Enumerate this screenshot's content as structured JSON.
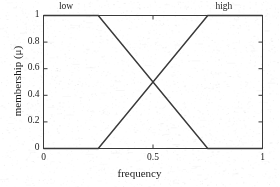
{
  "chart_data": {
    "type": "line",
    "title": "",
    "subtitle": "",
    "xlabel": "frequency",
    "ylabel": "membership (μ)",
    "xlim": [
      0,
      1
    ],
    "ylim": [
      0,
      1
    ],
    "xticks": [
      0,
      0.5,
      1
    ],
    "xticklabels": [
      "0",
      "0.5",
      "1"
    ],
    "yticks": [
      0,
      0.2,
      0.4,
      0.6,
      0.8,
      1
    ],
    "yticklabels": [
      "0",
      "0.2",
      "0.4",
      "0.6",
      "0.8",
      "1"
    ],
    "grid": false,
    "legend_position": "inline-annotations",
    "line_color": "#3a3a3a",
    "axis_color": "#3a3a3a",
    "background_color": "#ffffff",
    "annotations": [
      {
        "text": "low",
        "x": 0.125,
        "y": 1.06
      },
      {
        "text": "high",
        "x": 0.84,
        "y": 1.06
      }
    ],
    "series": [
      {
        "name": "low",
        "label": "low",
        "x": [
          0,
          0.25,
          0.75,
          1
        ],
        "values": [
          1,
          1,
          0,
          0
        ]
      },
      {
        "name": "high",
        "label": "high",
        "x": [
          0,
          0.25,
          0.75,
          1
        ],
        "values": [
          0,
          0,
          1,
          1
        ]
      }
    ],
    "crossing_point": {
      "x": 0.5,
      "y": 0.5
    }
  },
  "axes": {
    "x": {
      "label": "frequency",
      "ticks": [
        {
          "value": 0,
          "label": "0"
        },
        {
          "value": 0.5,
          "label": "0.5"
        },
        {
          "value": 1,
          "label": "1"
        }
      ]
    },
    "y": {
      "label": "membership (μ)",
      "ticks": [
        {
          "value": 0,
          "label": "0"
        },
        {
          "value": 0.2,
          "label": "0.2"
        },
        {
          "value": 0.4,
          "label": "0.4"
        },
        {
          "value": 0.6,
          "label": "0.6"
        },
        {
          "value": 0.8,
          "label": "0.8"
        },
        {
          "value": 1,
          "label": "1"
        }
      ]
    }
  },
  "annotations": {
    "low": "low",
    "high": "high"
  }
}
